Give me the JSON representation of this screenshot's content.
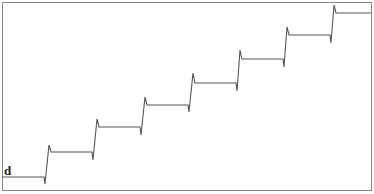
{
  "chart_data": {
    "type": "line",
    "title": "",
    "panel_label": "d",
    "xlabel": "",
    "ylabel": "",
    "grid": false,
    "legend": null,
    "steps": 7,
    "levels": [
      0,
      1,
      2,
      3,
      4,
      5,
      6,
      7
    ],
    "transition_x_px": [
      45,
      93,
      141,
      189,
      237,
      284,
      331
    ],
    "points_px": [
      [
        2,
        177
      ],
      [
        44,
        177
      ],
      [
        45,
        184
      ],
      [
        49,
        145
      ],
      [
        51,
        152
      ],
      [
        92,
        152
      ],
      [
        93,
        160
      ],
      [
        97,
        119
      ],
      [
        99,
        127
      ],
      [
        140,
        127
      ],
      [
        141,
        135
      ],
      [
        145,
        97
      ],
      [
        147,
        105
      ],
      [
        188,
        105
      ],
      [
        189,
        112
      ],
      [
        193,
        73
      ],
      [
        195,
        83
      ],
      [
        236,
        83
      ],
      [
        237,
        91
      ],
      [
        240,
        50
      ],
      [
        242,
        59
      ],
      [
        283,
        59
      ],
      [
        284,
        67
      ],
      [
        287,
        27
      ],
      [
        289,
        35
      ],
      [
        330,
        35
      ],
      [
        331,
        43
      ],
      [
        334,
        5
      ],
      [
        336,
        13
      ],
      [
        371,
        13
      ]
    ],
    "colors": {
      "line": "#555555",
      "frame": "#888888"
    }
  }
}
